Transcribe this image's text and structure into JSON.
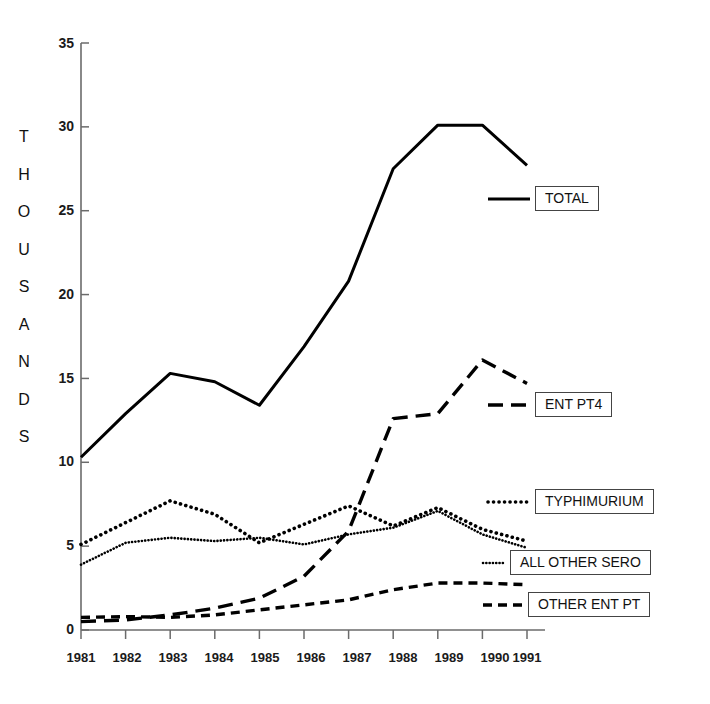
{
  "chart_data": {
    "type": "line",
    "title": "",
    "subtitle": "",
    "xlabel": "",
    "ylabel": "THOUSANDS",
    "ylabel_letters": [
      "T",
      "H",
      "O",
      "U",
      "S",
      "A",
      "N",
      "D",
      "S"
    ],
    "x": [
      1981,
      1982,
      1983,
      1984,
      1985,
      1986,
      1987,
      1988,
      1989,
      1990,
      1991
    ],
    "categories": [
      "1981",
      "1982",
      "1983",
      "1984",
      "1985",
      "1986",
      "1987",
      "1988",
      "1989",
      "1990",
      "1991"
    ],
    "xlim": [
      1981,
      1991
    ],
    "ylim": [
      0,
      35
    ],
    "yticks": [
      0,
      5,
      10,
      15,
      20,
      25,
      30,
      35
    ],
    "ytick_labels": [
      "0",
      "5",
      "10",
      "15",
      "20",
      "25",
      "30",
      "35"
    ],
    "grid": false,
    "legend_position": "right-inside",
    "series": [
      {
        "name": "TOTAL",
        "style": "solid",
        "color": "#000000",
        "values": [
          10.3,
          12.9,
          15.3,
          14.8,
          13.4,
          16.9,
          20.8,
          27.5,
          30.1,
          30.1,
          27.7
        ]
      },
      {
        "name": "ENT PT4",
        "style": "long-dash",
        "color": "#000000",
        "values": [
          0.5,
          0.6,
          0.9,
          1.3,
          1.9,
          3.2,
          5.9,
          12.6,
          12.9,
          16.1,
          14.7
        ]
      },
      {
        "name": "TYPHIMURIUM",
        "style": "coarse-dot",
        "color": "#000000",
        "values": [
          5.1,
          6.4,
          7.7,
          6.9,
          5.2,
          6.3,
          7.4,
          6.2,
          7.3,
          6.0,
          5.3
        ]
      },
      {
        "name": "ALL OTHER SERO",
        "style": "fine-dot",
        "color": "#000000",
        "values": [
          3.9,
          5.2,
          5.5,
          5.3,
          5.5,
          5.1,
          5.7,
          6.1,
          7.1,
          5.7,
          4.9
        ]
      },
      {
        "name": "OTHER ENT PT",
        "style": "medium-dash",
        "color": "#000000",
        "values": [
          0.75,
          0.8,
          0.75,
          0.9,
          1.2,
          1.5,
          1.8,
          2.4,
          2.8,
          2.8,
          2.7
        ]
      }
    ]
  },
  "legend": {
    "items": [
      {
        "label": "TOTAL",
        "style": "solid"
      },
      {
        "label": "ENT PT4",
        "style": "long-dash"
      },
      {
        "label": "TYPHIMURIUM",
        "style": "coarse-dot"
      },
      {
        "label": "ALL OTHER SERO",
        "style": "fine-dot"
      },
      {
        "label": "OTHER ENT PT",
        "style": "medium-dash"
      }
    ]
  },
  "axes": {
    "y_title": "THOUSANDS",
    "y_ticks": [
      "35",
      "30",
      "25",
      "20",
      "15",
      "10",
      "5",
      "0"
    ],
    "x_ticks": [
      "1981",
      "1982",
      "1983",
      "1984",
      "1985",
      "1986",
      "1987",
      "1988",
      "1989",
      "1990",
      "1991"
    ]
  },
  "colors": {
    "ink": "#000000",
    "axis": "#6b6b6b",
    "background": "#ffffff"
  }
}
